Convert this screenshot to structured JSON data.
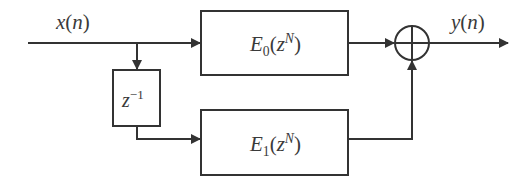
{
  "diagram": {
    "type": "block-diagram",
    "colors": {
      "line": "#333333",
      "text": "#3a3a3a",
      "background": "#ffffff"
    },
    "input": {
      "label": "x(n)",
      "sym": "x",
      "arg": "n"
    },
    "output": {
      "label": "y(n)",
      "sym": "y",
      "arg": "n"
    },
    "blocks": [
      {
        "id": "E0",
        "label": "E0(z^N)",
        "base": "E",
        "sub": "0",
        "arg": "z",
        "sup": "N"
      },
      {
        "id": "E1",
        "label": "E1(z^N)",
        "base": "E",
        "sub": "1",
        "arg": "z",
        "sup": "N"
      },
      {
        "id": "delay",
        "label": "z^-1",
        "base": "z",
        "sup": "−1"
      }
    ],
    "summer": {
      "symbol": "plus-circle"
    },
    "connections": [
      {
        "from": "x(n)",
        "to": "E0"
      },
      {
        "from": "x(n)",
        "to": "delay"
      },
      {
        "from": "delay",
        "to": "E1"
      },
      {
        "from": "E0",
        "to": "summer"
      },
      {
        "from": "E1",
        "to": "summer"
      },
      {
        "from": "summer",
        "to": "y(n)"
      }
    ]
  }
}
